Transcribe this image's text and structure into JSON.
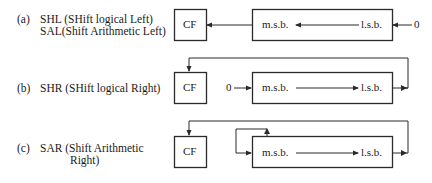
{
  "diagrams": [
    {
      "id": "a",
      "marker": "(a)",
      "label_lines": [
        "SHL (SHift logical Left)",
        "SAL(Shift Arithmetic Left)"
      ],
      "carry_flag": "CF",
      "msb": "m.s.b.",
      "lsb": "l.s.b.",
      "fill_input": "0",
      "direction": "left"
    },
    {
      "id": "b",
      "marker": "(b)",
      "label_lines": [
        "SHR (SHift logical Right)"
      ],
      "carry_flag": "CF",
      "msb": "m.s.b.",
      "lsb": "l.s.b.",
      "fill_input": "0",
      "direction": "right"
    },
    {
      "id": "c",
      "marker": "(c)",
      "label_lines": [
        "SAR (Shift Arithmetic",
        "Right)"
      ],
      "carry_flag": "CF",
      "msb": "m.s.b.",
      "lsb": "l.s.b.",
      "direction": "right",
      "sign_extend": true
    }
  ],
  "colors": {
    "stroke": "#2a2a2a",
    "text": "#1a1a1a",
    "background": "#ffffff"
  }
}
